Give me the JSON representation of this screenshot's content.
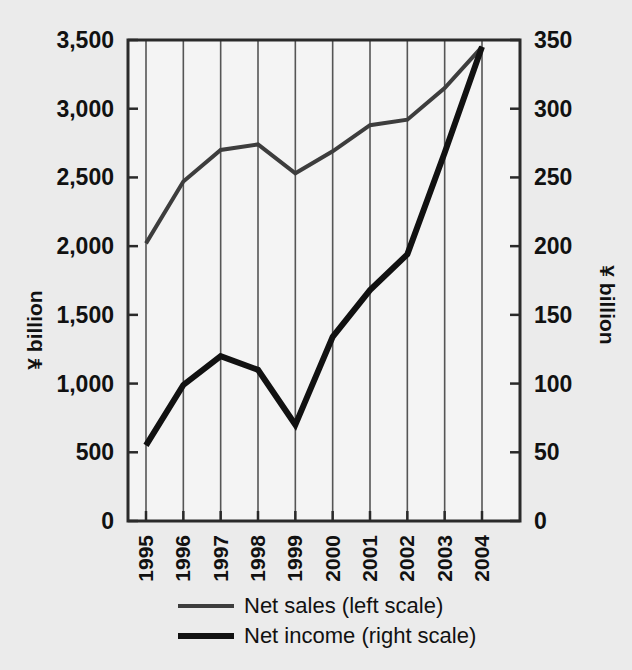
{
  "chart_data": {
    "type": "line",
    "title": "",
    "xlabel": "",
    "ylabel": "¥ billion",
    "y2label": "¥ billion",
    "categories": [
      "1995",
      "1996",
      "1997",
      "1998",
      "1999",
      "2000",
      "2001",
      "2002",
      "2003",
      "2004"
    ],
    "ylim": [
      0,
      3500
    ],
    "y2lim": [
      0,
      350
    ],
    "yticks": [
      "0",
      "500",
      "1,000",
      "1,500",
      "2,000",
      "2,500",
      "3,000",
      "3,500"
    ],
    "ytick_values": [
      0,
      500,
      1000,
      1500,
      2000,
      2500,
      3000,
      3500
    ],
    "y2ticks": [
      "0",
      "50",
      "100",
      "150",
      "200",
      "250",
      "300",
      "350"
    ],
    "y2tick_values": [
      0,
      50,
      100,
      150,
      200,
      250,
      300,
      350
    ],
    "grid": "vertical",
    "legend_position": "bottom",
    "series": [
      {
        "name": "Net sales (left scale)",
        "axis": "left",
        "color": "#3d3d3d",
        "width": 4,
        "values": [
          2020,
          2470,
          2700,
          2740,
          2530,
          2690,
          2880,
          2920,
          3150,
          3450
        ]
      },
      {
        "name": "Net income (right scale)",
        "axis": "right",
        "color": "#111111",
        "width": 6,
        "values": [
          55,
          99,
          120,
          110,
          70,
          134,
          168,
          194,
          268,
          345
        ]
      }
    ]
  },
  "legend": {
    "items": [
      {
        "label": "Net sales (left scale)",
        "color": "#3d3d3d",
        "width": 4
      },
      {
        "label": "Net income (right scale)",
        "color": "#111111",
        "width": 6
      }
    ]
  },
  "axes": {
    "left_title": "¥ billion",
    "right_title": "¥ billion"
  },
  "colors": {
    "background": "#ebebeb",
    "plot_background": "#f3f3f3",
    "axis": "#2a2a2a",
    "grid": "#555555",
    "text": "#111111",
    "net_sales": "#3d3d3d",
    "net_income": "#111111"
  }
}
